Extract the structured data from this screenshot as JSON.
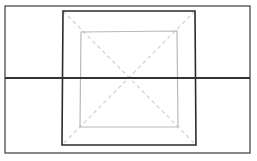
{
  "canvas": {
    "width": 257,
    "height": 161,
    "background": "#ffffff",
    "title": "Nested rectangles with diagonals and horizontal rule"
  },
  "palette": {
    "outer_stroke": "#3a3a3a",
    "middle_stroke": "#2b2b2b",
    "inner_stroke": "#b9b9b9",
    "diagonal_stroke": "#d2d2d2",
    "horizontal_stroke": "#333333"
  },
  "shapes": {
    "outer_rect": {
      "name": "outer rectangle",
      "x": 5,
      "y": 6,
      "width": 245,
      "height": 147,
      "stroke": "#3a3a3a",
      "stroke_width": 1.2,
      "fill": "none",
      "style": "solid"
    },
    "middle_rect": {
      "name": "middle rectangle",
      "x": 62,
      "y": 10,
      "width": 134,
      "height": 136,
      "stroke": "#2b2b2b",
      "stroke_width": 1.6,
      "fill": "none",
      "style": "solid",
      "points": "63,11 195,11 196,145 62,145"
    },
    "inner_square": {
      "name": "inner square",
      "x": 80,
      "y": 31,
      "width": 98,
      "height": 96,
      "stroke": "#b9b9b9",
      "stroke_width": 1.2,
      "fill": "none",
      "style": "solid",
      "points": "81,32 177,31 178,127 80,127"
    },
    "horizontal_line": {
      "name": "horizontal line",
      "x1": 5,
      "y1": 78,
      "x2": 250,
      "y2": 78,
      "stroke": "#333333",
      "stroke_width": 1.8,
      "style": "solid"
    },
    "diagonal_tl_br": {
      "name": "diagonal top-left to bottom-right",
      "x1": 63,
      "y1": 11,
      "x2": 196,
      "y2": 145,
      "stroke": "#d2d2d2",
      "stroke_width": 1.2,
      "style": "dashed",
      "dash_pattern": "4 3"
    },
    "diagonal_tr_bl": {
      "name": "diagonal top-right to bottom-left",
      "x1": 195,
      "y1": 11,
      "x2": 62,
      "y2": 145,
      "stroke": "#d2d2d2",
      "stroke_width": 1.2,
      "style": "dashed",
      "dash_pattern": "4 3"
    }
  },
  "annotations": {
    "center_x": 129,
    "center_y": 78
  }
}
